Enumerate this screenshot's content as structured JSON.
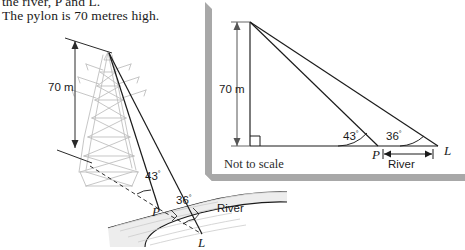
{
  "question": {
    "line1": "the river, P and L.",
    "line2": "The pylon is 70 metres high."
  },
  "scene_diagram": {
    "name": "pylon-river-perspective-diagram",
    "height_label": "70 m",
    "angle_upper_label": "43",
    "angle_lower_label": "36",
    "degree_symbol": "°",
    "point_p_label": "P",
    "point_l_label": "L",
    "river_label": "River",
    "pylon_color": "#b9b9b9",
    "line_color": "#1a1a1a",
    "river_fill": "#e8e8e8"
  },
  "inset_diagram": {
    "name": "not-to-scale-triangle-diagram",
    "height_label": "70 m",
    "angle_upper_label": "43",
    "angle_lower_label": "36",
    "degree_symbol": "°",
    "point_p_label": "P",
    "point_l_label": "L",
    "river_label": "River",
    "note": "Not to scale",
    "box_fill": "#ffffff",
    "shadow_color": "#a8a8a8",
    "line_color": "#1a1a1a"
  }
}
